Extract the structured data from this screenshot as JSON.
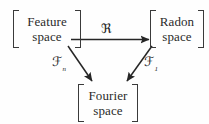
{
  "diagram": {
    "background_color": "#fefefe",
    "stroke_color": "#2b2b2b",
    "nodes": [
      {
        "id": "feature-space",
        "line1": "Feature",
        "line2": "space",
        "delimiter": "square-brackets"
      },
      {
        "id": "radon-space",
        "line1": "Radon",
        "line2": "space",
        "delimiter": "square-brackets"
      },
      {
        "id": "fourier-space",
        "line1": "Fourier",
        "line2": "space",
        "delimiter": "square-brackets"
      }
    ],
    "edges": [
      {
        "id": "feature-to-radon",
        "from": "feature-space",
        "to": "radon-space",
        "label_base": "ℜ",
        "label_sub": "",
        "direction": "horizontal-right"
      },
      {
        "id": "feature-to-fourier",
        "from": "feature-space",
        "to": "fourier-space",
        "label_base": "ℱ",
        "label_sub": "n",
        "direction": "diagonal-down-right"
      },
      {
        "id": "radon-to-fourier",
        "from": "radon-space",
        "to": "fourier-space",
        "label_base": "ℱ",
        "label_sub": "1",
        "direction": "diagonal-down-left"
      }
    ]
  }
}
